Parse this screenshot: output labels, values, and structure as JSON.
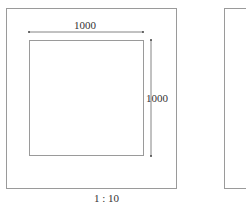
{
  "drawing": {
    "dimension_width": "1000",
    "dimension_height": "1000",
    "scale": "1 : 10"
  }
}
